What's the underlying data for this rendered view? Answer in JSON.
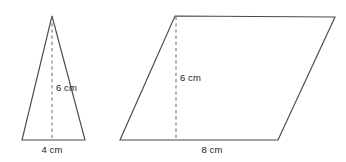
{
  "figure": {
    "background_color": "#ffffff",
    "outline_color": "#4a4a4a",
    "dash_color": "#6f6f6f",
    "label_color": "#1c1c1c"
  },
  "triangle": {
    "name": "triangle",
    "height_label": "6 cm",
    "base_label": "4 cm",
    "apex": [
      52,
      16
    ],
    "base_left": [
      22,
      140
    ],
    "base_right": [
      85,
      140
    ],
    "height_line": {
      "x": 52,
      "y_top": 17,
      "y_bottom": 140
    },
    "height_label_pos": [
      56,
      91
    ],
    "base_label_pos": [
      52,
      153
    ]
  },
  "parallelogram": {
    "name": "parallelogram",
    "height_label": "6 cm",
    "base_label": "8 cm",
    "top_left": [
      175,
      16
    ],
    "top_right": [
      335,
      17
    ],
    "bottom_right": [
      278,
      140
    ],
    "bottom_left": [
      120,
      140
    ],
    "height_line": {
      "x": 176,
      "y_top": 17,
      "y_bottom": 140
    },
    "height_label_pos": [
      180,
      81
    ],
    "base_label_pos": [
      212,
      153
    ]
  }
}
